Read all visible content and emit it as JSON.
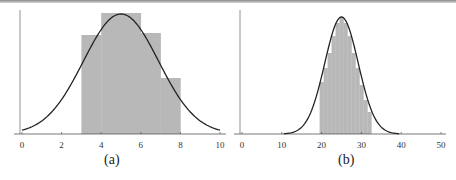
{
  "chart_data": [
    {
      "type": "bar",
      "title": "(a)",
      "xlabel": "",
      "ylabel": "",
      "xlim": [
        0,
        10
      ],
      "xticks": [
        0,
        2,
        4,
        6,
        8,
        10
      ],
      "grid": false,
      "bins": [
        {
          "x0": 3,
          "x1": 4,
          "height": 99
        },
        {
          "x0": 4,
          "x1": 6,
          "height": 121
        },
        {
          "x0": 6,
          "x1": 7,
          "height": 101
        },
        {
          "x0": 7,
          "x1": 8,
          "height": 56
        }
      ],
      "overlay_curve": {
        "type": "normal",
        "mean": 5,
        "sd": 1.9,
        "peak_height": 120
      },
      "bar_color": "#b8b8b8",
      "curve_color": "#222222"
    },
    {
      "type": "bar",
      "title": "(b)",
      "xlabel": "",
      "ylabel": "",
      "xlim": [
        0,
        50
      ],
      "xticks": [
        0,
        10,
        20,
        30,
        40,
        50
      ],
      "grid": false,
      "bins": [
        {
          "x0": 19.5,
          "x1": 20.5,
          "height": 52
        },
        {
          "x0": 20.5,
          "x1": 21.5,
          "height": 66
        },
        {
          "x0": 21.5,
          "x1": 22.5,
          "height": 81
        },
        {
          "x0": 22.5,
          "x1": 23.5,
          "height": 98
        },
        {
          "x0": 23.5,
          "x1": 24.5,
          "height": 111
        },
        {
          "x0": 24.5,
          "x1": 25.5,
          "height": 117
        },
        {
          "x0": 25.5,
          "x1": 26.5,
          "height": 111
        },
        {
          "x0": 26.5,
          "x1": 27.5,
          "height": 98
        },
        {
          "x0": 27.5,
          "x1": 28.5,
          "height": 81
        },
        {
          "x0": 28.5,
          "x1": 29.5,
          "height": 66
        },
        {
          "x0": 29.5,
          "x1": 30.5,
          "height": 49
        },
        {
          "x0": 30.5,
          "x1": 31.5,
          "height": 34
        },
        {
          "x0": 31.5,
          "x1": 32.5,
          "height": 22
        }
      ],
      "overlay_curve": {
        "type": "normal",
        "mean": 25,
        "sd": 4.2,
        "peak_height": 117
      },
      "bar_color": "#b8b8b8",
      "curve_color": "#222222"
    }
  ],
  "captions": {
    "a": "(a)",
    "b": "(b)"
  },
  "axis_a": {
    "labels": [
      "0",
      "2",
      "4",
      "6",
      "8",
      "10"
    ]
  },
  "axis_b": {
    "labels": [
      "0",
      "10",
      "20",
      "30",
      "40",
      "50"
    ]
  }
}
